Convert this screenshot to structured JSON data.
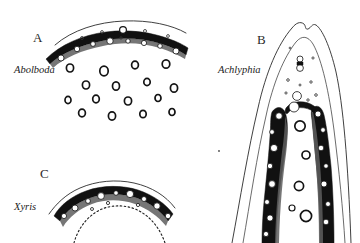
{
  "figure": {
    "background_color": "#ffffff",
    "ink_color": "#1a1a1a",
    "width": 360,
    "height": 243,
    "type": "scientific-line-drawing"
  },
  "panels": [
    {
      "id": "A",
      "letter": "A",
      "taxon": "Abolboda",
      "letter_x": 33,
      "letter_y": 42,
      "taxon_x": 14,
      "taxon_y": 73,
      "description": "transverse section with continuous dark sclerenchyma arc beneath epidermis and scattered ring-shaped vascular bundles in mesophyll"
    },
    {
      "id": "B",
      "letter": "B",
      "taxon": "Achlyphia",
      "letter_x": 257,
      "letter_y": 44,
      "taxon_x": 218,
      "taxon_y": 73,
      "description": "elongate apical section with double wavy outline and two dark lateral sclerenchyma strands enclosing white lumina"
    },
    {
      "id": "C",
      "letter": "C",
      "taxon": "Xyris",
      "letter_x": 40,
      "letter_y": 178,
      "taxon_x": 14,
      "taxon_y": 210,
      "description": "arched transverse section with dark sclerenchyma band containing white vascular lumina and inner dotted arc"
    }
  ]
}
